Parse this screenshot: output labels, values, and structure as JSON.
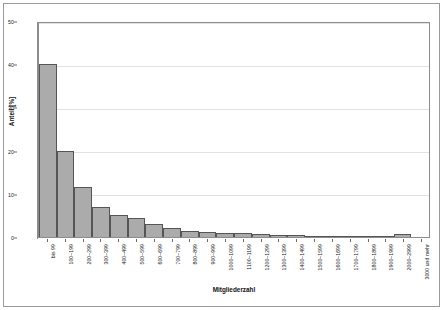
{
  "chart_data": {
    "type": "bar",
    "title": "",
    "xlabel": "Mitgliederzahl",
    "ylabel": "Anteil [%]",
    "ylim": [
      0,
      50
    ],
    "yticks": [
      0,
      10,
      20,
      30,
      40,
      50
    ],
    "grid": true,
    "legend": false,
    "bar_color": "#ababab",
    "bar_edge_color": "#555555",
    "categories": [
      "bis 99",
      "100–199",
      "200–299",
      "300–399",
      "400–499",
      "500–599",
      "600–699",
      "700–799",
      "800–899",
      "900–999",
      "1000–1099",
      "1100–1199",
      "1200–1299",
      "1300–1399",
      "1400–1499",
      "1500–1599",
      "1600–1699",
      "1700–1799",
      "1800–1899",
      "1900–1999",
      "2000–2999",
      "3000 und mehr"
    ],
    "values": [
      40,
      20,
      11.5,
      7,
      5,
      4.5,
      3,
      2,
      1.3,
      1.1,
      1,
      0.9,
      0.7,
      0.5,
      0.4,
      0.35,
      0.3,
      0.3,
      0.25,
      0.15,
      0.8,
      0
    ]
  }
}
